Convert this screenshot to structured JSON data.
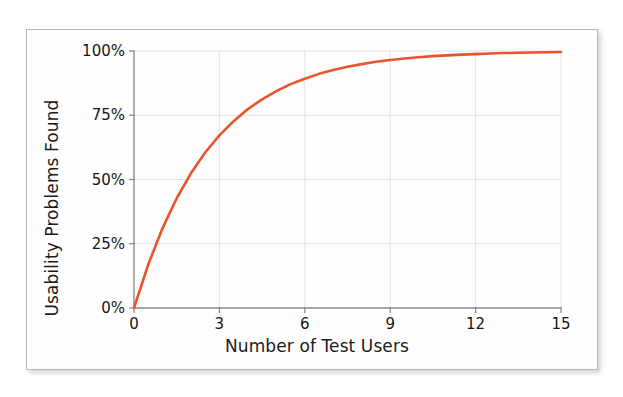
{
  "figure": {
    "background_color": "#fefefe",
    "border_color": "#b9b9b9"
  },
  "chart_data": {
    "type": "line",
    "title": "",
    "subtitle": "",
    "xlabel": "Number of Test Users",
    "ylabel": "Usability Problems Found",
    "xlim": [
      0,
      15
    ],
    "ylim": [
      0,
      100
    ],
    "xtick_labels": [
      "0",
      "3",
      "6",
      "9",
      "12",
      "15"
    ],
    "xtick_values": [
      0,
      3,
      6,
      9,
      12,
      15
    ],
    "ytick_labels": [
      "0%",
      "25%",
      "50%",
      "75%",
      "100%"
    ],
    "ytick_values": [
      0,
      25,
      50,
      75,
      100
    ],
    "grid": true,
    "grid_color": "#e3e3e3",
    "legend": "none",
    "line_color": "#e8552d",
    "line_width": 2.6,
    "annotations": [],
    "series": [
      {
        "name": "Usability Problems Found",
        "formula": "100 * (1 - (1 - 0.31)^n)",
        "x": [
          0,
          0.5,
          1,
          1.5,
          2,
          2.5,
          3,
          3.5,
          4,
          4.5,
          5,
          5.5,
          6,
          6.5,
          7,
          7.5,
          8,
          8.5,
          9,
          9.5,
          10,
          10.5,
          11,
          11.5,
          12,
          12.5,
          13,
          13.5,
          14,
          14.5,
          15
        ],
        "values": [
          0,
          16.9,
          31.0,
          42.7,
          52.4,
          60.5,
          67.2,
          72.7,
          77.4,
          81.2,
          84.4,
          87.1,
          89.2,
          91.1,
          92.6,
          93.9,
          94.9,
          95.8,
          96.5,
          97.1,
          97.6,
          98.0,
          98.3,
          98.6,
          98.8,
          99.0,
          99.2,
          99.3,
          99.4,
          99.5,
          99.6
        ]
      }
    ]
  }
}
